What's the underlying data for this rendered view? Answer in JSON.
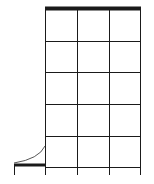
{
  "diagram": {
    "type": "grid-with-door-swing",
    "colors": {
      "line": "#1a1a1a",
      "background": "#ffffff",
      "arc": "#555555"
    },
    "grid": {
      "columns_x": [
        45,
        77,
        109,
        140
      ],
      "rows_y": [
        8,
        41,
        72,
        104,
        136,
        167
      ],
      "vertical_extend_to_y": 175,
      "top_edge_thick": true
    },
    "stub": {
      "bar": {
        "x1": 14,
        "x2": 45,
        "y": 165
      },
      "tick": {
        "x": 14,
        "y1": 165,
        "y2": 175
      },
      "arc": {
        "from": [
          14,
          163
        ],
        "to": [
          45,
          146
        ]
      }
    }
  }
}
